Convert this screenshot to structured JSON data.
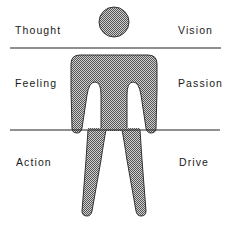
{
  "diagram": {
    "labels": {
      "top_left": "Thought",
      "top_right": "Vision",
      "middle_left": "Feeling",
      "middle_right": "Passion",
      "bottom_left": "Action",
      "bottom_right": "Drive"
    },
    "figure": {
      "type": "human-silhouette",
      "fill_pattern": "stipple",
      "stroke_color": "#333333",
      "fill_color": "#9a9a9a"
    },
    "divider_lines": [
      {
        "y": 48,
        "from_x": 10,
        "to_x": 221
      },
      {
        "y": 130,
        "from_x": 10,
        "to_x": 220
      }
    ]
  }
}
